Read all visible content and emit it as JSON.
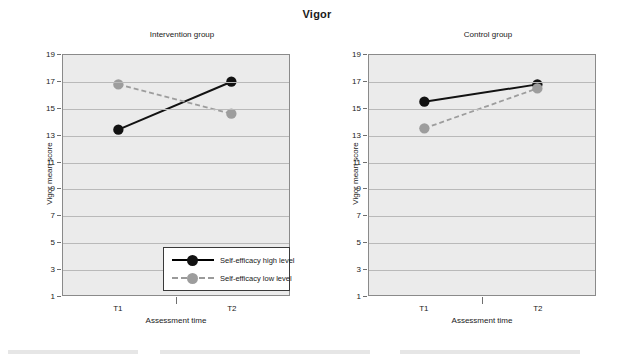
{
  "figure": {
    "title": "Vigor"
  },
  "axes": {
    "y_title": "Vigor mean score",
    "x_title": "Assessment time",
    "y_ticks": [
      1,
      3,
      5,
      7,
      9,
      11,
      13,
      15,
      17,
      19
    ],
    "x_ticks": [
      "T1",
      "T2"
    ],
    "y_min": 1,
    "y_max": 19
  },
  "legend": {
    "items": [
      {
        "label": "Self-efficacy high level",
        "style": "solid",
        "color": "#121212"
      },
      {
        "label": "Self-efficacy low level",
        "style": "dashed",
        "color": "#9d9d9d"
      }
    ]
  },
  "panels": [
    {
      "title": "Intervention group"
    },
    {
      "title": "Control group"
    }
  ],
  "colors": {
    "high_level": "#121212",
    "low_level": "#9d9d9d",
    "plot_background": "#ebebeb",
    "gridline": "#b9b9b9",
    "axis": "#8a8a8a"
  },
  "chart_data": {
    "type": "line",
    "title": "Vigor",
    "xlabel": "Assessment time",
    "ylabel": "Vigor mean score",
    "ylim": [
      1,
      19
    ],
    "ytick_step": 2,
    "grid": true,
    "legend_position": "inside bottom-right of left panel",
    "x": [
      "T1",
      "T2"
    ],
    "panels": [
      {
        "name": "Intervention group",
        "series": [
          {
            "name": "Self-efficacy high level",
            "style": "solid",
            "marker": "filled-circle-black",
            "values": [
              13.4,
              17.0
            ]
          },
          {
            "name": "Self-efficacy low level",
            "style": "dashed",
            "marker": "filled-circle-gray",
            "values": [
              16.8,
              14.6
            ]
          }
        ]
      },
      {
        "name": "Control group",
        "series": [
          {
            "name": "Self-efficacy high level",
            "style": "solid",
            "marker": "filled-circle-black",
            "values": [
              15.5,
              16.8
            ]
          },
          {
            "name": "Self-efficacy low level",
            "style": "dashed",
            "marker": "filled-circle-gray",
            "values": [
              13.5,
              16.5
            ]
          }
        ]
      }
    ]
  }
}
